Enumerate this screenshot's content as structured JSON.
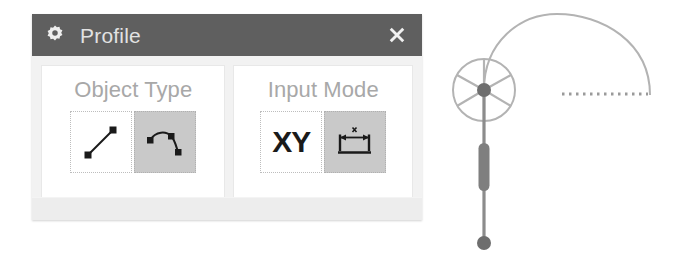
{
  "dialog": {
    "title": "Profile",
    "title_icon": "gear-icon",
    "close_icon": "close-icon",
    "colors": {
      "titlebar_background": "#5f5f5f",
      "title_text": "#e2e2e2",
      "panel_background": "#f2f2f2",
      "groupbox_background": "#ffffff",
      "group_label_text": "#a8a8a8",
      "button_selected_background": "#c9c9c9",
      "button_unselected_background": "#ffffff",
      "icon_stroke": "#1a1a1a"
    },
    "groups": [
      {
        "id": "object-type",
        "label": "Object Type",
        "buttons": [
          {
            "id": "line",
            "icon": "line-segment-icon",
            "label": "",
            "selected": false
          },
          {
            "id": "curve",
            "icon": "spline-curve-icon",
            "label": "",
            "selected": true
          }
        ]
      },
      {
        "id": "input-mode",
        "label": "Input Mode",
        "buttons": [
          {
            "id": "xy",
            "icon": "xy-text-icon",
            "label": "XY",
            "selected": false
          },
          {
            "id": "dimension",
            "icon": "dimension-span-icon",
            "label": "",
            "selected": true
          }
        ]
      }
    ]
  },
  "canvas": {
    "name": "profile-handle-graphic",
    "colors": {
      "wheel_stroke": "#b3b3b3",
      "hub_fill": "#6e6e6e",
      "stem_stroke": "#8c8c8c",
      "stem_thick_fill": "#7f7f7f",
      "end_node_fill": "#6e6e6e",
      "arc_stroke": "#b3b3b3",
      "dotted_line_stroke": "#9a9a9a"
    },
    "elements": [
      {
        "name": "rotation-wheel",
        "shape": "spoked-circle",
        "spokes": 6
      },
      {
        "name": "hub-node",
        "shape": "circle"
      },
      {
        "name": "stem-line",
        "shape": "vertical-line"
      },
      {
        "name": "stem-thick-segment",
        "shape": "capsule"
      },
      {
        "name": "stem-end-node",
        "shape": "circle"
      },
      {
        "name": "profile-arc",
        "shape": "arc"
      },
      {
        "name": "dotted-baseline",
        "shape": "dotted-horizontal-line"
      }
    ]
  }
}
